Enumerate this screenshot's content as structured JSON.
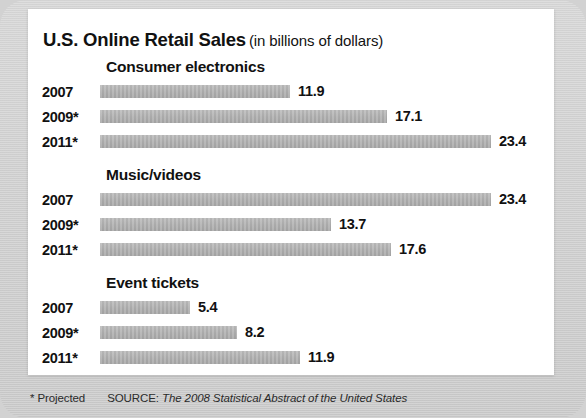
{
  "title": {
    "main": "U.S. Online Retail Sales",
    "sub": "(in billions of dollars)"
  },
  "footer": {
    "note": "* Projected",
    "source_label": "SOURCE:",
    "source_title": "The 2008 Statistical Abstract of the United States"
  },
  "colors": {
    "bar": "#adadad",
    "card": "#ffffff",
    "background": "#d2d2d2",
    "text": "#111111"
  },
  "chart_data": {
    "type": "bar",
    "orientation": "horizontal",
    "xlabel": "",
    "ylabel": "",
    "unit": "billions of dollars",
    "grid": false,
    "legend": null,
    "axis_max": 23.4,
    "categories": [
      "2007",
      "2009*",
      "2011*"
    ],
    "groups": [
      {
        "name": "Consumer electronics",
        "points": [
          {
            "category": "2007",
            "value": 11.9,
            "label": "11.9",
            "bar_px": 190
          },
          {
            "category": "2009*",
            "value": 17.1,
            "label": "17.1",
            "bar_px": 287
          },
          {
            "category": "2011*",
            "value": 23.4,
            "label": "23.4",
            "bar_px": 391
          }
        ]
      },
      {
        "name": "Music/videos",
        "points": [
          {
            "category": "2007",
            "value": 23.4,
            "label": "23.4",
            "bar_px": 391
          },
          {
            "category": "2009*",
            "value": 13.7,
            "label": "13.7",
            "bar_px": 231
          },
          {
            "category": "2011*",
            "value": 17.6,
            "label": "17.6",
            "bar_px": 291
          }
        ]
      },
      {
        "name": "Event tickets",
        "points": [
          {
            "category": "2007",
            "value": 5.4,
            "label": "5.4",
            "bar_px": 90
          },
          {
            "category": "2009*",
            "value": 8.2,
            "label": "8.2",
            "bar_px": 137
          },
          {
            "category": "2011*",
            "value": 11.9,
            "label": "11.9",
            "bar_px": 200
          }
        ]
      }
    ],
    "annotations": [
      "* Projected"
    ]
  }
}
